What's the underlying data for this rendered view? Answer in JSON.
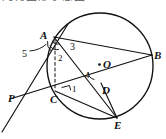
{
  "figure": {
    "title_band_text": "几何图形示意图",
    "background_color": "#ffffff",
    "stroke_color": "#111111",
    "width": 166,
    "height": 139
  },
  "circle": {
    "center_label": "O",
    "center_x": 100,
    "center_y": 66,
    "radius": 53
  },
  "points": [
    {
      "id": "A",
      "label": "A",
      "x": 54,
      "y": 37,
      "label_x": 40,
      "label_y": 30
    },
    {
      "id": "B",
      "label": "B",
      "x": 152,
      "y": 55,
      "label_x": 154,
      "label_y": 50
    },
    {
      "id": "C",
      "label": "C",
      "x": 55,
      "y": 91,
      "label_x": 50,
      "label_y": 94
    },
    {
      "id": "D",
      "label": "D",
      "x": 101,
      "y": 83,
      "label_x": 102,
      "label_y": 85
    },
    {
      "id": "E",
      "label": "E",
      "x": 117,
      "y": 118,
      "label_x": 114,
      "label_y": 120
    },
    {
      "id": "P",
      "label": "P",
      "x": 17,
      "y": 97,
      "label_x": 8,
      "label_y": 93
    },
    {
      "id": "O",
      "label": "O",
      "x": 100,
      "y": 66,
      "label_x": 103,
      "label_y": 59
    }
  ],
  "angle_labels": [
    {
      "id": "angle-1",
      "text": "1",
      "x": 72,
      "y": 85,
      "size": "small"
    },
    {
      "id": "angle-2",
      "text": "2",
      "x": 58,
      "y": 54,
      "size": "small"
    },
    {
      "id": "angle-3",
      "text": "3",
      "x": 70,
      "y": 42,
      "size": "big"
    },
    {
      "id": "angle-4",
      "text": "4",
      "x": 85,
      "y": 71,
      "size": "small"
    },
    {
      "id": "angle-5",
      "text": "5",
      "x": 22,
      "y": 49,
      "size": "big"
    }
  ],
  "segments": [
    {
      "id": "tangent-PA",
      "from": "P-extended",
      "to": "A-extended",
      "style": "solid"
    },
    {
      "id": "secant-PB",
      "from": "P",
      "to": "B",
      "style": "solid"
    },
    {
      "id": "chord-AB",
      "from": "A",
      "to": "B",
      "style": "solid"
    },
    {
      "id": "chord-AE",
      "from": "A",
      "to": "E",
      "style": "solid"
    },
    {
      "id": "chord-CE",
      "from": "C",
      "to": "E",
      "style": "solid"
    },
    {
      "id": "segment-DE",
      "from": "D",
      "to": "E",
      "style": "solid"
    },
    {
      "id": "altitude-AC",
      "from": "A",
      "to": "C",
      "style": "dashed"
    }
  ]
}
